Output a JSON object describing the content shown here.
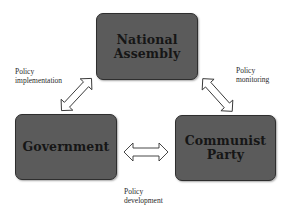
{
  "diagram": {
    "nodes": [
      {
        "id": "national-assembly",
        "lines": [
          "National",
          "Assembly"
        ]
      },
      {
        "id": "government",
        "lines": [
          "Government"
        ]
      },
      {
        "id": "communist-party",
        "lines": [
          "Communist",
          "Party"
        ]
      }
    ],
    "edges": [
      {
        "from": "government",
        "to": "national-assembly",
        "label_lines": [
          "Policy",
          "implementation"
        ],
        "type": "bidirectional"
      },
      {
        "from": "national-assembly",
        "to": "communist-party",
        "label_lines": [
          "Policy",
          "monitoring"
        ],
        "type": "bidirectional"
      },
      {
        "from": "government",
        "to": "communist-party",
        "label_lines": [
          "Policy",
          "development"
        ],
        "type": "bidirectional"
      }
    ]
  },
  "colors": {
    "node_fill": "#5b5b5b",
    "node_border": "#2e2e2e",
    "node_text": "#161616",
    "arrow_fill": "#ffffff",
    "arrow_stroke": "#333333",
    "label_text": "#2a2a2a",
    "background": "#ffffff"
  }
}
